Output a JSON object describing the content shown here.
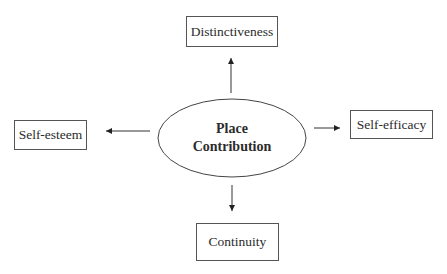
{
  "diagram": {
    "center": {
      "line1": "Place",
      "line2": "Contribution"
    },
    "nodes": {
      "top": "Distinctiveness",
      "left": "Self-esteem",
      "right": "Self-efficacy",
      "bottom": "Continuity"
    },
    "edges": [
      {
        "from": "Place Contribution",
        "to": "Distinctiveness"
      },
      {
        "from": "Place Contribution",
        "to": "Self-esteem"
      },
      {
        "from": "Place Contribution",
        "to": "Self-efficacy"
      },
      {
        "from": "Place Contribution",
        "to": "Continuity"
      }
    ],
    "stroke_color": "#333333"
  }
}
